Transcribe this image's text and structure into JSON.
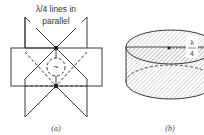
{
  "figure": {
    "panel_a": {
      "annotation_line1": "λ/4 lines in",
      "annotation_line2": "parallel",
      "source_symbol": "~",
      "caption": "(a)"
    },
    "panel_b": {
      "label_numerator": "λ",
      "label_denominator": "4",
      "caption": "(b)"
    },
    "colors": {
      "line": "#3a3a3a",
      "hatch": "#9a9a9a"
    }
  }
}
